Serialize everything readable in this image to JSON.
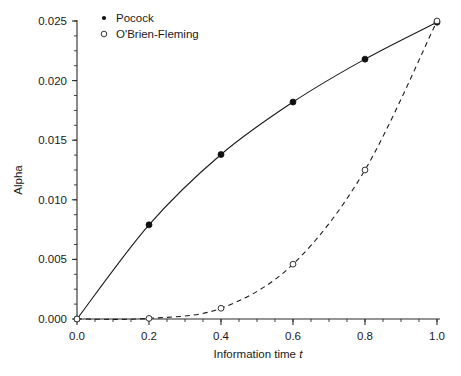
{
  "chart_data": {
    "type": "line",
    "title": "",
    "xlabel": "Information time t",
    "xlabel_prefix": "Information time ",
    "xlabel_italic": "t",
    "ylabel": "Alpha",
    "xlim": [
      0.0,
      1.0
    ],
    "ylim": [
      0.0,
      0.025
    ],
    "grid": false,
    "legend_position": "top-left-inside",
    "x": [
      0.0,
      0.2,
      0.4,
      0.6,
      0.8,
      1.0
    ],
    "xticks": [
      "0.0",
      "0.2",
      "0.4",
      "0.6",
      "0.8",
      "1.0"
    ],
    "xtick_values": [
      0.0,
      0.2,
      0.4,
      0.6,
      0.8,
      1.0
    ],
    "yticks": [
      "0.000",
      "0.005",
      "0.010",
      "0.015",
      "0.020",
      "0.025"
    ],
    "ytick_values": [
      0.0,
      0.005,
      0.01,
      0.015,
      0.02,
      0.025
    ],
    "x_minor_interval": 0.05,
    "y_minor_interval": 0.00125,
    "series": [
      {
        "name": "Pocock",
        "marker": "filled-circle",
        "linestyle": "solid",
        "color": "#101010",
        "values": [
          0.0,
          0.0079,
          0.0138,
          0.0182,
          0.0218,
          0.0249
        ]
      },
      {
        "name": "O'Brien-Fleming",
        "marker": "open-circle",
        "linestyle": "dashed",
        "color": "#333333",
        "values": [
          0.0,
          5e-05,
          0.0009,
          0.0046,
          0.0125,
          0.025
        ]
      }
    ]
  },
  "legend": {
    "entries": [
      {
        "label": "Pocock",
        "marker": "filled-circle"
      },
      {
        "label": "O'Brien-Fleming",
        "marker": "open-circle"
      }
    ]
  }
}
